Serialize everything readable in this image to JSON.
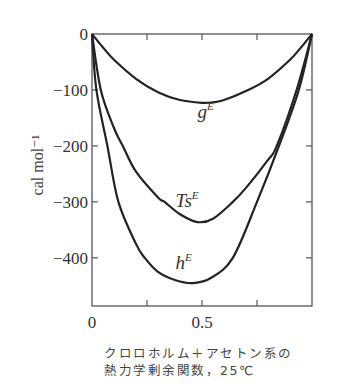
{
  "chart_data": {
    "type": "line",
    "title": "",
    "xlabel": "",
    "ylabel": "cal mol⁻¹",
    "xlim": [
      0,
      1
    ],
    "ylim": [
      -486,
      0
    ],
    "x_ticks": [
      0,
      0.25,
      0.5,
      0.75,
      1
    ],
    "x_tick_labels": [
      "0",
      "",
      "0.5",
      "",
      ""
    ],
    "y_ticks": [
      0,
      -100,
      -200,
      -300,
      -400
    ],
    "y_tick_labels": [
      "0",
      "−100",
      "−200",
      "−300",
      "−400"
    ],
    "grid": false,
    "legend": "none",
    "series": [
      {
        "name": "gE",
        "label_base": "g",
        "label_sup": "E",
        "x": [
          0,
          0.05,
          0.1,
          0.2,
          0.3,
          0.4,
          0.5,
          0.55,
          0.6,
          0.7,
          0.8,
          0.9,
          0.95,
          1
        ],
        "values": [
          0,
          -24,
          -46,
          -80,
          -104,
          -118,
          -123,
          -122,
          -118,
          -102,
          -80,
          -46,
          -24,
          0
        ]
      },
      {
        "name": "TsE",
        "label_base": "Ts",
        "label_sup": "E",
        "x": [
          0,
          0.04,
          0.1,
          0.14,
          0.2,
          0.3,
          0.33,
          0.4,
          0.48,
          0.55,
          0.64,
          0.7,
          0.8,
          0.84,
          0.93,
          1
        ],
        "values": [
          0,
          -100,
          -168,
          -200,
          -246,
          -292,
          -300,
          -322,
          -336,
          -330,
          -300,
          -275,
          -225,
          -200,
          -100,
          0
        ]
      },
      {
        "name": "hE",
        "label_base": "h",
        "label_sup": "E",
        "x": [
          0,
          0.02,
          0.07,
          0.12,
          0.2,
          0.24,
          0.3,
          0.38,
          0.46,
          0.54,
          0.64,
          0.75,
          0.85,
          0.94,
          1
        ],
        "values": [
          0,
          -100,
          -200,
          -300,
          -375,
          -400,
          -425,
          -440,
          -445,
          -436,
          -400,
          -300,
          -200,
          -100,
          0
        ]
      }
    ],
    "annotations": [
      {
        "text": "g",
        "sup": "E",
        "x": 0.48,
        "y": -150
      },
      {
        "text": "Ts",
        "sup": "E",
        "x": 0.38,
        "y": -310
      },
      {
        "text": "h",
        "sup": "E",
        "x": 0.38,
        "y": -420
      }
    ]
  },
  "caption": {
    "line1": "クロロホルム＋アセトン系の",
    "line2": "熱力学剰余関数，25℃"
  }
}
